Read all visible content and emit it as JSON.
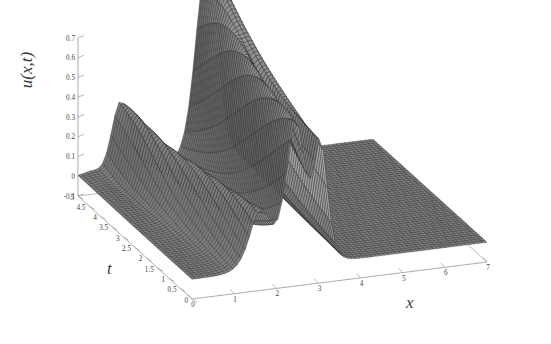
{
  "figure": {
    "background": "#ffffff",
    "type": "3d-mesh-surface-plot",
    "style": "matlab-mesh"
  },
  "labels": {
    "z": "u(x,t)",
    "x": "x",
    "t": "t"
  },
  "chart_data": {
    "type": "surface",
    "title": "",
    "xlabel": "x",
    "ylabel": "t",
    "zlabel": "u(x,t)",
    "grid": false,
    "legend": null,
    "xlim": [
      0,
      7
    ],
    "ylim": [
      0,
      5
    ],
    "zlim": [
      -0.1,
      0.7
    ],
    "xticks": [
      0,
      1,
      2,
      3,
      4,
      5,
      6,
      7
    ],
    "xticklabels": [
      "0",
      "1",
      "2",
      "3",
      "4",
      "5",
      "6",
      "7"
    ],
    "yticks": [
      0,
      0.5,
      1,
      1.5,
      2,
      2.5,
      3,
      3.5,
      4,
      4.5,
      5
    ],
    "yticklabels": [
      "0",
      "0.5",
      "1",
      "1.5",
      "2",
      "2.5",
      "3",
      "3.5",
      "4",
      "4.5",
      "5"
    ],
    "zticks": [
      -0.1,
      0,
      0.1,
      0.2,
      0.3,
      0.4,
      0.5,
      0.6,
      0.7
    ],
    "zticklabels": [
      "-0.1",
      "0",
      "0.1",
      "0.2",
      "0.3",
      "0.4",
      "0.5",
      "0.6",
      "0.7"
    ],
    "surface_model": {
      "nx": 72,
      "nt": 56,
      "solitons": [
        {
          "amplitude": 0.72,
          "center_x0": 2.45,
          "width": 0.3,
          "speed": 0.1
        },
        {
          "amplitude": 0.58,
          "center_x0": 3.05,
          "width": 0.22,
          "speed": 0.03
        },
        {
          "amplitude": 0.3,
          "center_x0": 1.62,
          "width": 0.34,
          "speed": -0.12
        }
      ],
      "ripple": {
        "amplitude": 0.055,
        "wavenumber": 7.0,
        "x_center": 1.0,
        "x_width": 0.55,
        "t_onset": 2.6
      }
    },
    "colors": {
      "mesh_line": "#262626",
      "face_dark": "#565656",
      "face_mid": "#7d7d7d",
      "face_light": "#c8c8c8",
      "axis_line": "#8a8a8a",
      "tick_text": "#444444"
    }
  },
  "axes_render": {
    "origin_px": {
      "x": 192,
      "y": 299
    },
    "x_end_px": {
      "x": 487,
      "y": 262
    },
    "t_end_px": {
      "x": 78,
      "y": 196
    },
    "z_top_px": {
      "x": 78,
      "y": 38
    }
  }
}
